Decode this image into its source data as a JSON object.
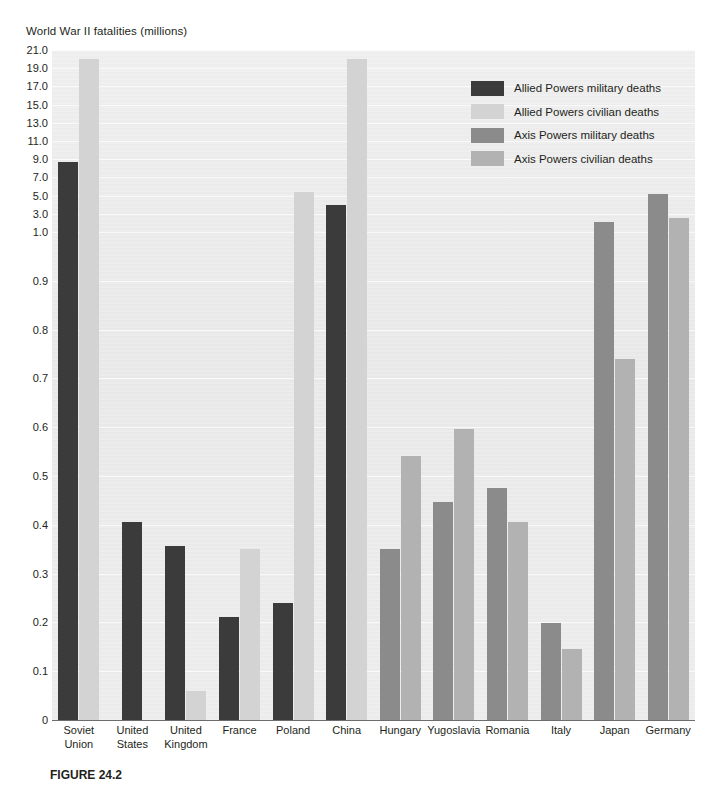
{
  "figure": {
    "axis_title": "World War II fatalities (millions)",
    "caption": "FIGURE 24.2"
  },
  "legend": {
    "items": [
      {
        "label": "Allied Powers military deaths",
        "color": "#3b3b3b"
      },
      {
        "label": "Allied Powers civilian deaths",
        "color": "#d3d3d3"
      },
      {
        "label": "Axis Powers military deaths",
        "color": "#8b8b8b"
      },
      {
        "label": "Axis Powers civilian deaths",
        "color": "#b2b2b2"
      }
    ]
  },
  "chart_data": {
    "type": "bar",
    "title": "World War II fatalities (millions)",
    "xlabel": "",
    "ylabel": "World War II fatalities (millions)",
    "grid": true,
    "legend_position": "top-right",
    "axis_note": "broken / nonlinear y-axis: 0-1.0 expanded in 0.1 steps, 1.0-21.0 in 2.0 steps",
    "yticks": [
      0,
      0.1,
      0.2,
      0.3,
      0.4,
      0.5,
      0.6,
      0.7,
      0.8,
      0.9,
      1.0,
      3.0,
      5.0,
      7.0,
      9.0,
      11.0,
      13.0,
      15.0,
      17.0,
      19.0,
      21.0
    ],
    "ytick_labels": [
      "0",
      "0.1",
      "0.2",
      "0.3",
      "0.4",
      "0.5",
      "0.6",
      "0.7",
      "0.8",
      "0.9",
      "1.0",
      "3.0",
      "5.0",
      "7.0",
      "9.0",
      "11.0",
      "13.0",
      "15.0",
      "17.0",
      "19.0",
      "21.0"
    ],
    "ylim": [
      0,
      21.0
    ],
    "categories": [
      "Soviet Union",
      "United States",
      "United Kingdom",
      "France",
      "Poland",
      "China",
      "Hungary",
      "Yugoslavia",
      "Romania",
      "Italy",
      "Japan",
      "Germany"
    ],
    "series": [
      {
        "name": "Allied Powers military deaths",
        "color": "#3b3b3b",
        "values": [
          8.7,
          0.405,
          0.357,
          0.212,
          0.24,
          4.0,
          null,
          null,
          null,
          null,
          null,
          null
        ]
      },
      {
        "name": "Allied Powers civilian deaths",
        "color": "#d3d3d3",
        "values": [
          20.0,
          null,
          0.06,
          0.35,
          5.4,
          20.0,
          null,
          null,
          null,
          null,
          null,
          null
        ]
      },
      {
        "name": "Axis Powers military deaths",
        "color": "#8b8b8b",
        "values": [
          null,
          null,
          null,
          null,
          null,
          null,
          0.35,
          0.446,
          0.476,
          0.199,
          2.12,
          5.2
        ]
      },
      {
        "name": "Axis Powers civilian deaths",
        "color": "#b2b2b2",
        "values": [
          null,
          null,
          null,
          null,
          null,
          null,
          0.542,
          0.597,
          0.405,
          0.145,
          0.74,
          2.5
        ]
      }
    ]
  }
}
